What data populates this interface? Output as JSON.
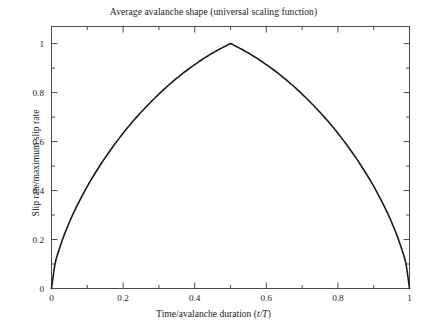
{
  "chart_data": {
    "type": "line",
    "title": "Average avalanche shape (universal scaling function)",
    "xlabel_prefix": "Time/avalanche duration (",
    "xlabel_symbol": "t/T",
    "xlabel_suffix": ")",
    "ylabel": "Slip rate/maximum slip rate",
    "xlim": [
      0,
      1
    ],
    "ylim": [
      0,
      1.07
    ],
    "grid": false,
    "legend": "none",
    "xticks_major": [
      0,
      0.2,
      0.4,
      0.6,
      0.8,
      1
    ],
    "xticklabels": [
      "0",
      "0.2",
      "0.4",
      "0.6",
      "0.8",
      "1"
    ],
    "xticks_minor": [
      0.1,
      0.3,
      0.5,
      0.7,
      0.9
    ],
    "yticks_major": [
      0,
      0.2,
      0.4,
      0.6,
      0.8,
      1
    ],
    "yticklabels": [
      "0",
      "0.2",
      "0.4",
      "0.6",
      "0.8",
      "1"
    ],
    "yticks_minor": [
      0.1,
      0.3,
      0.5,
      0.7,
      0.9
    ],
    "series": [
      {
        "name": "average avalanche shape",
        "color": "#1a1a1a",
        "linewidth": 1.6,
        "x": [
          0,
          0.01,
          0.02,
          0.03,
          0.04,
          0.05,
          0.06,
          0.07,
          0.08,
          0.09,
          0.1,
          0.11,
          0.12,
          0.13,
          0.14,
          0.15,
          0.16,
          0.17,
          0.18,
          0.19,
          0.2,
          0.21,
          0.22,
          0.23,
          0.24,
          0.25,
          0.26,
          0.27,
          0.28,
          0.29,
          0.3,
          0.31,
          0.32,
          0.33,
          0.34,
          0.35,
          0.36,
          0.37,
          0.38,
          0.39,
          0.4,
          0.41,
          0.42,
          0.43,
          0.44,
          0.45,
          0.46,
          0.47,
          0.48,
          0.49,
          0.5,
          0.51,
          0.52,
          0.53,
          0.54,
          0.55,
          0.56,
          0.57,
          0.58,
          0.59,
          0.6,
          0.61,
          0.62,
          0.63,
          0.64,
          0.65,
          0.66,
          0.67,
          0.68,
          0.69,
          0.7,
          0.71,
          0.72,
          0.73,
          0.74,
          0.75,
          0.76,
          0.77,
          0.78,
          0.79,
          0.8,
          0.81,
          0.82,
          0.83,
          0.84,
          0.85,
          0.86,
          0.87,
          0.88,
          0.89,
          0.9,
          0.91,
          0.92,
          0.93,
          0.94,
          0.95,
          0.96,
          0.97,
          0.98,
          0.99,
          1
        ],
        "y": [
          0,
          0.0854,
          0.1295,
          0.1661,
          0.1986,
          0.2284,
          0.256,
          0.2819,
          0.3064,
          0.3297,
          0.352,
          0.3733,
          0.3938,
          0.4135,
          0.4326,
          0.451,
          0.4688,
          0.4861,
          0.5028,
          0.519,
          0.5348,
          0.5501,
          0.5649,
          0.5794,
          0.5934,
          0.6071,
          0.6204,
          0.6333,
          0.6459,
          0.6581,
          0.67,
          0.6815,
          0.6928,
          0.7037,
          0.7143,
          0.7246,
          0.7346,
          0.7443,
          0.7537,
          0.7628,
          0.7716,
          0.7801,
          0.7883,
          0.7963,
          0.8039,
          0.8113,
          0.8183,
          0.8251,
          0.8316,
          0.8378,
          0.8437,
          0.8378,
          0.8316,
          0.8251,
          0.8183,
          0.8113,
          0.8039,
          0.7963,
          0.7883,
          0.7801,
          0.7716,
          0.7628,
          0.7537,
          0.7443,
          0.7346,
          0.7246,
          0.7143,
          0.7037,
          0.6928,
          0.6815,
          0.67,
          0.6581,
          0.6459,
          0.6333,
          0.6204,
          0.6071,
          0.5934,
          0.5794,
          0.5649,
          0.5501,
          0.5348,
          0.519,
          0.5028,
          0.4861,
          0.4688,
          0.451,
          0.4326,
          0.4135,
          0.3938,
          0.3733,
          0.352,
          0.3297,
          0.3064,
          0.2819,
          0.256,
          0.2284,
          0.1986,
          0.1661,
          0.1295,
          0.0854,
          0
        ],
        "peak_x": 0.5,
        "peak_y": 1,
        "endpoints": [
          [
            0,
            0
          ],
          [
            1,
            0
          ]
        ]
      }
    ],
    "axis_color": "#4a4a4a",
    "frame": "box-all-sides-ticks-inward"
  }
}
